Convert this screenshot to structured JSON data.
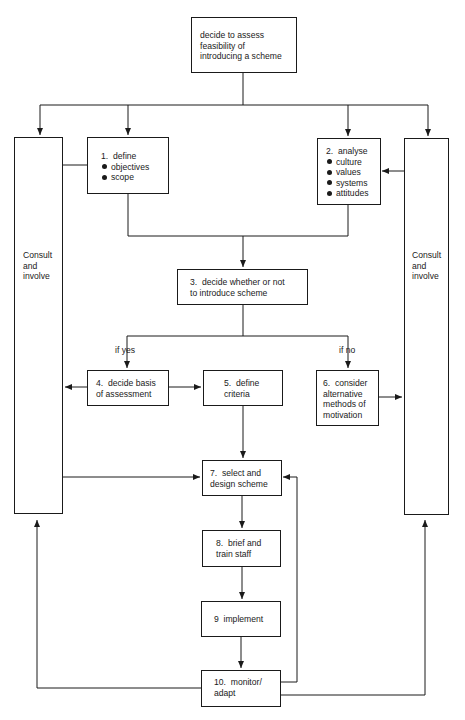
{
  "diagram": {
    "type": "flowchart",
    "start": {
      "text": "decide to assess\nfeasibility of\nintroducing a scheme"
    },
    "side_left": {
      "text": "Consult\nand\ninvolve"
    },
    "side_right": {
      "text": "Consult\nand\ninvolve"
    },
    "steps": [
      {
        "id": 1,
        "title": "1.  define",
        "bullets": [
          "objectives",
          "scope"
        ]
      },
      {
        "id": 2,
        "title": "2.  analyse",
        "bullets": [
          "culture",
          "values",
          "systems",
          "attitudes"
        ]
      },
      {
        "id": 3,
        "text": "3.  decide whether or not\nto introduce scheme"
      },
      {
        "id": 4,
        "text": "4.  decide basis\nof assessment"
      },
      {
        "id": 5,
        "text": "5.  define\ncriteria"
      },
      {
        "id": 6,
        "text": "6.  consider\nalternative\nmethods of\nmotivation"
      },
      {
        "id": 7,
        "text": "7.  select and\ndesign scheme"
      },
      {
        "id": 8,
        "text": "8.  brief and\ntrain staff"
      },
      {
        "id": 9,
        "text": "9  implement"
      },
      {
        "id": 10,
        "text": "10.  monitor/\nadapt"
      }
    ],
    "branch_labels": {
      "yes": "if yes",
      "no": "if no"
    },
    "line_color": "#1a1a1a"
  }
}
